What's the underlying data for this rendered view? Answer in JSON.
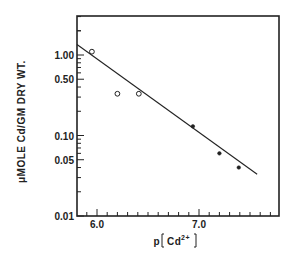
{
  "chart_data": {
    "type": "scatter",
    "title": "",
    "xlabel": "p[Cd2+]",
    "xlabel_parts": {
      "prefix": "p",
      "species": "Cd",
      "charge": "2+"
    },
    "ylabel": "μMOLE Cd/GM DRY WT.",
    "yscale": "log",
    "xlim": [
      5.8,
      7.8
    ],
    "ylim": [
      0.01,
      3.0
    ],
    "x_ticks": [
      6.0,
      7.0
    ],
    "x_tick_labels": [
      "6.0",
      "7.0"
    ],
    "y_ticks": [
      0.01,
      0.05,
      0.1,
      0.5,
      1.0
    ],
    "y_tick_labels": [
      "0.01",
      "0.05",
      "0.10",
      "0.50",
      "1.00"
    ],
    "grid": false,
    "legend": null,
    "series": [
      {
        "name": "open circles",
        "marker": "open-circle",
        "points": [
          {
            "x": 5.95,
            "y": 1.1
          },
          {
            "x": 6.2,
            "y": 0.33
          },
          {
            "x": 6.41,
            "y": 0.33
          }
        ]
      },
      {
        "name": "filled circles",
        "marker": "filled-circle",
        "points": [
          {
            "x": 6.94,
            "y": 0.13
          },
          {
            "x": 7.2,
            "y": 0.06
          },
          {
            "x": 7.39,
            "y": 0.04
          }
        ]
      },
      {
        "name": "regression line",
        "type": "line",
        "points": [
          {
            "x": 5.8,
            "y": 1.35
          },
          {
            "x": 7.57,
            "y": 0.033
          }
        ]
      }
    ]
  },
  "colors": {
    "ink": "#222222",
    "background": "#ffffff"
  }
}
